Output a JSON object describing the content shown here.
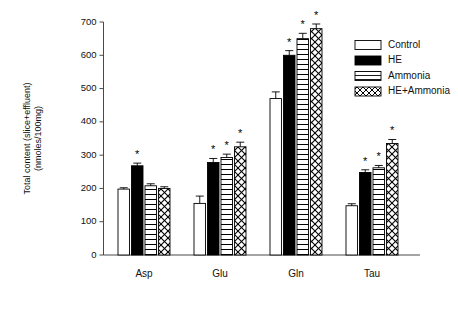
{
  "chart_data": {
    "type": "bar",
    "title": "",
    "subtitle": "",
    "xlabel": "",
    "ylabel": "Total content (slice+effluent)\n(nmoles/100mg)",
    "ylabel_line1": "Total content (slice+effluent)",
    "ylabel_line2": "(nmoles/100mg)",
    "categories": [
      "Asp",
      "Glu",
      "Gln",
      "Tau"
    ],
    "ylim": [
      0,
      700
    ],
    "ytick_values": [
      0,
      100,
      200,
      300,
      400,
      500,
      600,
      700
    ],
    "ytick_labels": [
      "0",
      "100",
      "200",
      "300",
      "400",
      "500",
      "600",
      "700"
    ],
    "grid": false,
    "legend_position": "top-right",
    "series": [
      {
        "name": "Control",
        "fill": "open",
        "values": [
          198,
          155,
          470,
          148
        ],
        "errors": [
          4,
          22,
          20,
          6
        ],
        "significant": [
          false,
          false,
          false,
          false
        ]
      },
      {
        "name": "HE",
        "fill": "solid-black",
        "values": [
          268,
          278,
          600,
          248
        ],
        "errors": [
          8,
          12,
          14,
          8
        ],
        "significant": [
          true,
          true,
          true,
          true
        ]
      },
      {
        "name": "Ammonia",
        "fill": "horizontal-lines",
        "values": [
          208,
          293,
          650,
          262
        ],
        "errors": [
          6,
          10,
          16,
          7
        ],
        "significant": [
          false,
          true,
          true,
          true
        ]
      },
      {
        "name": "HE+Ammonia",
        "fill": "cross-hatch",
        "values": [
          200,
          325,
          680,
          335
        ],
        "errors": [
          5,
          14,
          14,
          12
        ],
        "significant": [
          false,
          true,
          true,
          true
        ]
      }
    ],
    "significance_marker": "*"
  },
  "legend": {
    "items": [
      {
        "label": "Control"
      },
      {
        "label": "HE"
      },
      {
        "label": "Ammonia"
      },
      {
        "label": "HE+Ammonia"
      }
    ]
  },
  "colors": {
    "axis": "#4a4a4a",
    "bar_outline": "#000000",
    "solid_fill": "#000000",
    "open_fill": "#ffffff",
    "text": "#111111",
    "background": "#ffffff"
  }
}
